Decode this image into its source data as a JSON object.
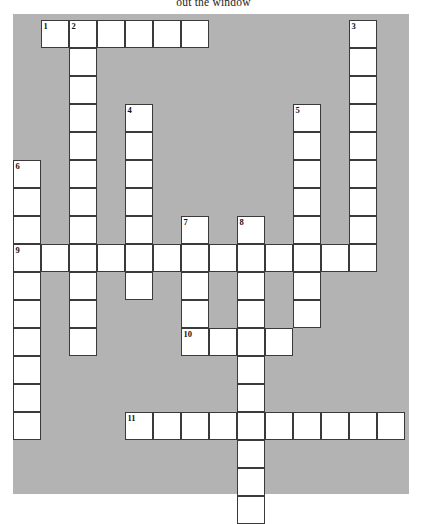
{
  "title": {
    "text": "out the window"
  },
  "colors": {
    "board_background": "#b3b3b3",
    "cell_fill": "#ffffff",
    "cell_border": "#3a3a3a",
    "page_background": "#ffffff",
    "number_color": "#111111"
  },
  "grid": {
    "columns": 14,
    "rows": 17,
    "cell_size": 28,
    "origin_x": 0,
    "origin_y": 6
  },
  "entries": [
    {
      "number": "1",
      "direction": "across",
      "row": 0,
      "col": 1,
      "length": 6
    },
    {
      "number": "2",
      "direction": "down",
      "row": 0,
      "col": 2,
      "length": 12
    },
    {
      "number": "3",
      "direction": "down",
      "row": 0,
      "col": 12,
      "length": 9
    },
    {
      "number": "4",
      "direction": "down",
      "row": 3,
      "col": 4,
      "length": 7
    },
    {
      "number": "5",
      "direction": "down",
      "row": 3,
      "col": 10,
      "length": 7
    },
    {
      "number": "6",
      "direction": "down",
      "row": 5,
      "col": 0,
      "length": 10
    },
    {
      "number": "7",
      "direction": "down",
      "row": 7,
      "col": 6,
      "length": 5
    },
    {
      "number": "8",
      "direction": "down",
      "row": 7,
      "col": 8,
      "length": 11
    },
    {
      "number": "9",
      "direction": "across",
      "row": 8,
      "col": 0,
      "length": 13
    },
    {
      "number": "10",
      "direction": "across",
      "row": 11,
      "col": 6,
      "length": 4
    },
    {
      "number": "11",
      "direction": "across",
      "row": 14,
      "col": 4,
      "length": 10
    }
  ],
  "cells": [
    {
      "r": 0,
      "c": 1,
      "n": "1"
    },
    {
      "r": 0,
      "c": 2,
      "n": "2"
    },
    {
      "r": 0,
      "c": 3,
      "n": ""
    },
    {
      "r": 0,
      "c": 4,
      "n": ""
    },
    {
      "r": 0,
      "c": 5,
      "n": ""
    },
    {
      "r": 0,
      "c": 6,
      "n": ""
    },
    {
      "r": 0,
      "c": 12,
      "n": "3"
    },
    {
      "r": 1,
      "c": 2,
      "n": ""
    },
    {
      "r": 1,
      "c": 12,
      "n": ""
    },
    {
      "r": 2,
      "c": 2,
      "n": ""
    },
    {
      "r": 2,
      "c": 12,
      "n": ""
    },
    {
      "r": 3,
      "c": 2,
      "n": ""
    },
    {
      "r": 3,
      "c": 4,
      "n": "4"
    },
    {
      "r": 3,
      "c": 10,
      "n": "5"
    },
    {
      "r": 3,
      "c": 12,
      "n": ""
    },
    {
      "r": 4,
      "c": 2,
      "n": ""
    },
    {
      "r": 4,
      "c": 4,
      "n": ""
    },
    {
      "r": 4,
      "c": 10,
      "n": ""
    },
    {
      "r": 4,
      "c": 12,
      "n": ""
    },
    {
      "r": 5,
      "c": 0,
      "n": "6"
    },
    {
      "r": 5,
      "c": 2,
      "n": ""
    },
    {
      "r": 5,
      "c": 4,
      "n": ""
    },
    {
      "r": 5,
      "c": 10,
      "n": ""
    },
    {
      "r": 5,
      "c": 12,
      "n": ""
    },
    {
      "r": 6,
      "c": 0,
      "n": ""
    },
    {
      "r": 6,
      "c": 2,
      "n": ""
    },
    {
      "r": 6,
      "c": 4,
      "n": ""
    },
    {
      "r": 6,
      "c": 10,
      "n": ""
    },
    {
      "r": 6,
      "c": 12,
      "n": ""
    },
    {
      "r": 7,
      "c": 0,
      "n": ""
    },
    {
      "r": 7,
      "c": 2,
      "n": ""
    },
    {
      "r": 7,
      "c": 4,
      "n": ""
    },
    {
      "r": 7,
      "c": 6,
      "n": "7"
    },
    {
      "r": 7,
      "c": 8,
      "n": "8"
    },
    {
      "r": 7,
      "c": 10,
      "n": ""
    },
    {
      "r": 7,
      "c": 12,
      "n": ""
    },
    {
      "r": 8,
      "c": 0,
      "n": "9"
    },
    {
      "r": 8,
      "c": 1,
      "n": ""
    },
    {
      "r": 8,
      "c": 2,
      "n": ""
    },
    {
      "r": 8,
      "c": 3,
      "n": ""
    },
    {
      "r": 8,
      "c": 4,
      "n": ""
    },
    {
      "r": 8,
      "c": 5,
      "n": ""
    },
    {
      "r": 8,
      "c": 6,
      "n": ""
    },
    {
      "r": 8,
      "c": 7,
      "n": ""
    },
    {
      "r": 8,
      "c": 8,
      "n": ""
    },
    {
      "r": 8,
      "c": 9,
      "n": ""
    },
    {
      "r": 8,
      "c": 10,
      "n": ""
    },
    {
      "r": 8,
      "c": 11,
      "n": ""
    },
    {
      "r": 8,
      "c": 12,
      "n": ""
    },
    {
      "r": 9,
      "c": 0,
      "n": ""
    },
    {
      "r": 9,
      "c": 2,
      "n": ""
    },
    {
      "r": 9,
      "c": 4,
      "n": ""
    },
    {
      "r": 9,
      "c": 6,
      "n": ""
    },
    {
      "r": 9,
      "c": 8,
      "n": ""
    },
    {
      "r": 9,
      "c": 10,
      "n": ""
    },
    {
      "r": 10,
      "c": 0,
      "n": ""
    },
    {
      "r": 10,
      "c": 2,
      "n": ""
    },
    {
      "r": 10,
      "c": 6,
      "n": ""
    },
    {
      "r": 10,
      "c": 8,
      "n": ""
    },
    {
      "r": 10,
      "c": 10,
      "n": ""
    },
    {
      "r": 11,
      "c": 0,
      "n": ""
    },
    {
      "r": 11,
      "c": 2,
      "n": ""
    },
    {
      "r": 11,
      "c": 6,
      "n": "10"
    },
    {
      "r": 11,
      "c": 7,
      "n": ""
    },
    {
      "r": 11,
      "c": 8,
      "n": ""
    },
    {
      "r": 11,
      "c": 9,
      "n": ""
    },
    {
      "r": 12,
      "c": 0,
      "n": ""
    },
    {
      "r": 12,
      "c": 8,
      "n": ""
    },
    {
      "r": 13,
      "c": 0,
      "n": ""
    },
    {
      "r": 13,
      "c": 8,
      "n": ""
    },
    {
      "r": 14,
      "c": 0,
      "n": ""
    },
    {
      "r": 14,
      "c": 4,
      "n": "11"
    },
    {
      "r": 14,
      "c": 5,
      "n": ""
    },
    {
      "r": 14,
      "c": 6,
      "n": ""
    },
    {
      "r": 14,
      "c": 7,
      "n": ""
    },
    {
      "r": 14,
      "c": 8,
      "n": ""
    },
    {
      "r": 14,
      "c": 9,
      "n": ""
    },
    {
      "r": 14,
      "c": 10,
      "n": ""
    },
    {
      "r": 14,
      "c": 11,
      "n": ""
    },
    {
      "r": 14,
      "c": 12,
      "n": ""
    },
    {
      "r": 14,
      "c": 13,
      "n": ""
    },
    {
      "r": 15,
      "c": 8,
      "n": ""
    },
    {
      "r": 16,
      "c": 8,
      "n": ""
    },
    {
      "r": 17,
      "c": 8,
      "n": ""
    }
  ]
}
